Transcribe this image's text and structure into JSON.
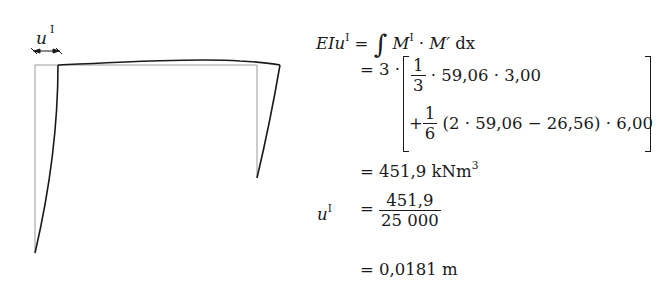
{
  "diagram": {
    "label_main": "u",
    "label_sup": "I"
  },
  "equations": {
    "line1": {
      "lhs": "EIu",
      "lhs_sup": "I",
      "eq": "=",
      "integral": "∫",
      "M": "M",
      "M_sup": "I",
      "dot": "·",
      "Mprime": "M′",
      "dx": "dx"
    },
    "line2": {
      "eq": "=",
      "factor": "3 ·",
      "frac_num": "1",
      "frac_den": "3",
      "rest": "· 59,06 · 3,00"
    },
    "line3": {
      "plus": "+",
      "frac_num": "1",
      "frac_den": "6",
      "rest": "(2 · 59,06 − 26,56) · 6,00"
    },
    "line4": {
      "eq": "=",
      "value": "451,9",
      "unit": "kNm",
      "unit_sup": "3"
    },
    "line5": {
      "lhs": "u",
      "lhs_sup": "I",
      "eq": "=",
      "frac_num": "451,9",
      "frac_den": "25 000"
    },
    "line6": {
      "eq": "=",
      "value": "0,0181",
      "unit": "m"
    }
  }
}
